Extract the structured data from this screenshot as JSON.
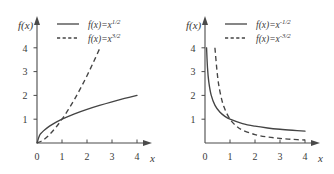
{
  "figure": {
    "background_color": "#ffffff",
    "line_color": "#444444",
    "text_color": "#3a3a3a"
  },
  "chart_data": [
    {
      "type": "line",
      "panel": "left",
      "title": "",
      "xlabel": "x",
      "ylabel": "f(x)",
      "xlim": [
        0,
        4.4
      ],
      "ylim": [
        0,
        4.4
      ],
      "xticks": [
        "0",
        "1",
        "2",
        "3",
        "4"
      ],
      "yticks": [
        "0",
        "1",
        "2",
        "3",
        "4"
      ],
      "xtick_values": [
        0,
        1,
        2,
        3,
        4
      ],
      "ytick_values": [
        0,
        1,
        2,
        3,
        4
      ],
      "grid": false,
      "legend_position": "top-right",
      "series": [
        {
          "name": "f(x)=x^1/2",
          "legend_base": "f(x)=x",
          "legend_exponent": "1/2",
          "style": "solid",
          "x": [
            0,
            0.1,
            0.2,
            0.3,
            0.5,
            0.75,
            1,
            1.5,
            2,
            2.5,
            3,
            3.5,
            4
          ],
          "y": [
            0,
            0.316,
            0.447,
            0.548,
            0.707,
            0.866,
            1,
            1.225,
            1.414,
            1.581,
            1.732,
            1.871,
            2
          ]
        },
        {
          "name": "f(x)=x^3/2",
          "legend_base": "f(x)=x",
          "legend_exponent": "3/2",
          "style": "dashed",
          "x": [
            0,
            0.25,
            0.5,
            0.75,
            1,
            1.25,
            1.5,
            1.75,
            2,
            2.25,
            2.5
          ],
          "y": [
            0,
            0.125,
            0.354,
            0.65,
            1,
            1.398,
            1.837,
            2.315,
            2.828,
            3.375,
            3.953
          ]
        }
      ]
    },
    {
      "type": "line",
      "panel": "right",
      "title": "",
      "xlabel": "x",
      "ylabel": "f(x)",
      "xlim": [
        0,
        4.4
      ],
      "ylim": [
        0,
        4.4
      ],
      "xticks": [
        "0",
        "1",
        "2",
        "3",
        "4"
      ],
      "yticks": [
        "0",
        "1",
        "2",
        "3",
        "4"
      ],
      "xtick_values": [
        0,
        1,
        2,
        3,
        4
      ],
      "ytick_values": [
        0,
        1,
        2,
        3,
        4
      ],
      "grid": false,
      "legend_position": "top-right",
      "series": [
        {
          "name": "f(x)=x^-1/2",
          "legend_base": "f(x)=x",
          "legend_exponent": "-1/2",
          "style": "solid",
          "x": [
            0.0625,
            0.1,
            0.15,
            0.25,
            0.4,
            0.6,
            0.8,
            1,
            1.5,
            2,
            2.5,
            3,
            3.5,
            4
          ],
          "y": [
            4,
            3.162,
            2.582,
            2,
            1.581,
            1.291,
            1.118,
            1,
            0.816,
            0.707,
            0.632,
            0.577,
            0.535,
            0.5
          ]
        },
        {
          "name": "f(x)=x^-3/2",
          "legend_base": "f(x)=x",
          "legend_exponent": "-3/2",
          "style": "dashed",
          "x": [
            0.397,
            0.5,
            0.6,
            0.75,
            1,
            1.25,
            1.5,
            2,
            2.5,
            3,
            3.5,
            4
          ],
          "y": [
            4,
            2.828,
            2.152,
            1.54,
            1,
            0.716,
            0.544,
            0.354,
            0.253,
            0.192,
            0.153,
            0.125
          ]
        }
      ]
    }
  ]
}
